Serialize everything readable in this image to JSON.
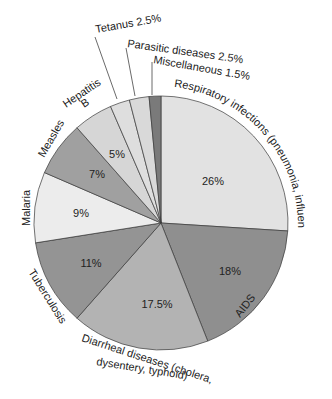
{
  "chart_data": {
    "type": "pie",
    "title": "",
    "start_angle_deg": 0,
    "direction": "clockwise",
    "slices": [
      {
        "label": "Respiratory infections (pneumonia, influenza)",
        "value": 26,
        "value_label": "26%",
        "color": "#e2e2e2"
      },
      {
        "label": "AIDS",
        "value": 18,
        "value_label": "18%",
        "color": "#8f8f8f"
      },
      {
        "label": "Diarrheal diseases (cholera, dysentery, typhoid)",
        "value": 17.5,
        "value_label": "17.5%",
        "color": "#b3b3b3"
      },
      {
        "label": "Tuberculosis",
        "value": 11,
        "value_label": "11%",
        "color": "#949494"
      },
      {
        "label": "Malaria",
        "value": 9,
        "value_label": "9%",
        "color": "#ececec"
      },
      {
        "label": "Measles",
        "value": 7,
        "value_label": "7%",
        "color": "#a0a0a0"
      },
      {
        "label": "Hepatitis B",
        "value": 5,
        "value_label": "5%",
        "color": "#d6d6d6"
      },
      {
        "label": "Tetanus",
        "value": 2.5,
        "value_label": "2.5%",
        "color": "#dedede"
      },
      {
        "label": "Parasitic diseases",
        "value": 2.5,
        "value_label": "2.5%",
        "color": "#d9d9d9"
      },
      {
        "label": "Miscellaneous",
        "value": 1.5,
        "value_label": "1.5%",
        "color": "#7a7a7a"
      }
    ]
  },
  "labels": {
    "respiratory": "Respiratory infections (pneumonia, influenza)",
    "aids": "AIDS",
    "diarrheal_line1": "Diarrheal diseases (cholera,",
    "diarrheal_line2": "dysentery, typhoid)",
    "tuberculosis": "Tuberculosis",
    "malaria": "Malaria",
    "measles": "Measles",
    "hepatitis_line1": "Hepatitis",
    "hepatitis_line2": "B",
    "tetanus": "Tetanus 2.5%",
    "parasitic": "Parasitic diseases 2.5%",
    "miscellaneous": "Miscellaneous 1.5%"
  }
}
